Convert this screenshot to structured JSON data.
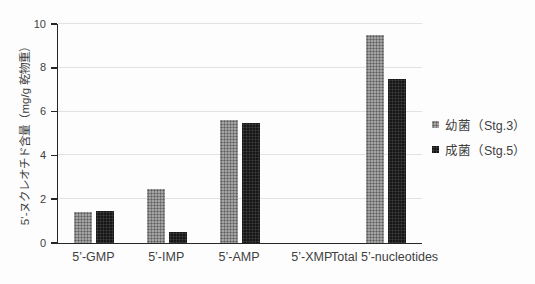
{
  "chart_data": {
    "type": "bar",
    "categories": [
      "5’-GMP",
      "5’-IMP",
      "5’-AMP",
      "5’-XMP",
      "Total 5’-nucleotides"
    ],
    "series": [
      {
        "name": "幼菌（Stg.3）",
        "values": [
          1.4,
          2.45,
          5.6,
          0,
          9.5
        ]
      },
      {
        "name": "成菌（Stg.5）",
        "values": [
          1.45,
          0.5,
          5.5,
          0,
          7.5
        ]
      }
    ],
    "title": "",
    "xlabel": "",
    "ylabel": "5’-ヌクレオチド含量（mg/g 乾物重）",
    "ylim": [
      0,
      10
    ],
    "yticks": [
      0,
      2,
      4,
      6,
      8,
      10
    ],
    "grid": true,
    "legend_position": "right",
    "series_colors": [
      "#8f8f8f",
      "#161616"
    ],
    "gridline_color": "#e2e2e2",
    "axis_color": "#262626",
    "text_color": "#3f3f3f"
  }
}
